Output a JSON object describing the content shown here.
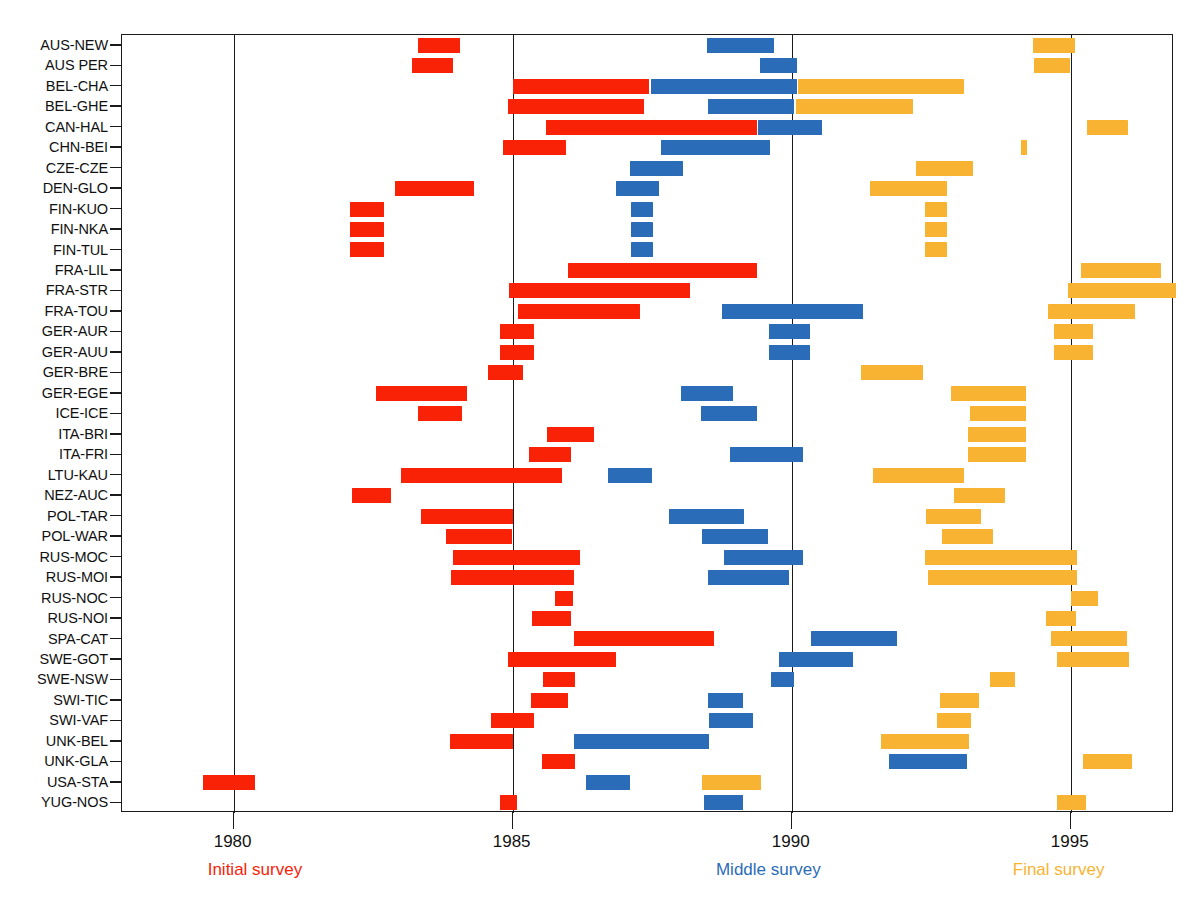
{
  "chart_data": {
    "type": "bar",
    "title": "",
    "xlabel": "",
    "ylabel": "",
    "xlim": [
      1978.0,
      1996.85
    ],
    "grid": true,
    "gridlines": [
      1980,
      1985,
      1990,
      1995
    ],
    "xticks": [
      1980,
      1985,
      1990,
      1995
    ],
    "xtick_labels": [
      "1980",
      "1985",
      "1990",
      "1995"
    ],
    "legend_position": "below-axis",
    "legend": [
      {
        "label": "Initial survey",
        "color": "#f92207",
        "x": 1980.4
      },
      {
        "label": "Middle survey",
        "color": "#2b6cb8",
        "x": 1989.6
      },
      {
        "label": "Final survey",
        "color": "#f9b333",
        "x": 1994.8
      }
    ],
    "series": [
      {
        "name": "Initial survey",
        "color": "#f92207"
      },
      {
        "name": "Middle survey",
        "color": "#2b6cb8"
      },
      {
        "name": "Final survey",
        "color": "#f9b333"
      }
    ],
    "categories": [
      "AUS-NEW",
      "AUS PER",
      "BEL-CHA",
      "BEL-GHE",
      "CAN-HAL",
      "CHN-BEI",
      "CZE-CZE",
      "DEN-GLO",
      "FIN-KUO",
      "FIN-NKA",
      "FIN-TUL",
      "FRA-LIL",
      "FRA-STR",
      "FRA-TOU",
      "GER-AUR",
      "GER-AUU",
      "GER-BRE",
      "GER-EGE",
      "ICE-ICE",
      "ITA-BRI",
      "ITA-FRI",
      "LTU-KAU",
      "NEZ-AUC",
      "POL-TAR",
      "POL-WAR",
      "RUS-MOC",
      "RUS-MOI",
      "RUS-NOC",
      "RUS-NOI",
      "SPA-CAT",
      "SWE-GOT",
      "SWE-NSW",
      "SWI-TIC",
      "SWI-VAF",
      "UNK-BEL",
      "UNK-GLA",
      "USA-STA",
      "YUG-NOS"
    ],
    "rows": [
      {
        "site": "AUS-NEW",
        "bars": [
          {
            "survey": "Initial survey",
            "start": 1983.3,
            "end": 1984.05
          },
          {
            "survey": "Middle survey",
            "start": 1988.48,
            "end": 1989.68
          },
          {
            "survey": "Final survey",
            "start": 1994.32,
            "end": 1995.08
          }
        ]
      },
      {
        "site": "AUS PER",
        "bars": [
          {
            "survey": "Initial survey",
            "start": 1983.2,
            "end": 1983.93
          },
          {
            "survey": "Middle survey",
            "start": 1989.43,
            "end": 1990.1
          },
          {
            "survey": "Final survey",
            "start": 1994.35,
            "end": 1994.98
          }
        ]
      },
      {
        "site": "BEL-CHA",
        "bars": [
          {
            "survey": "Initial survey",
            "start": 1985.0,
            "end": 1987.45
          },
          {
            "survey": "Middle survey",
            "start": 1987.47,
            "end": 1990.1
          },
          {
            "survey": "Final survey",
            "start": 1990.12,
            "end": 1993.08
          }
        ]
      },
      {
        "site": "BEL-GHE",
        "bars": [
          {
            "survey": "Initial survey",
            "start": 1984.92,
            "end": 1987.35
          },
          {
            "survey": "Middle survey",
            "start": 1988.5,
            "end": 1990.05
          },
          {
            "survey": "Final survey",
            "start": 1990.07,
            "end": 1992.18
          }
        ]
      },
      {
        "site": "CAN-HAL",
        "bars": [
          {
            "survey": "Initial survey",
            "start": 1985.6,
            "end": 1989.37
          },
          {
            "survey": "Middle survey",
            "start": 1989.39,
            "end": 1990.55
          },
          {
            "survey": "Final survey",
            "start": 1995.3,
            "end": 1996.02
          }
        ]
      },
      {
        "site": "CHN-BEI",
        "bars": [
          {
            "survey": "Initial survey",
            "start": 1984.82,
            "end": 1985.95
          },
          {
            "survey": "Middle survey",
            "start": 1987.65,
            "end": 1989.62
          },
          {
            "survey": "Final survey",
            "start": 1994.1,
            "end": 1994.22
          }
        ]
      },
      {
        "site": "CZE-CZE",
        "bars": [
          {
            "survey": "Middle survey",
            "start": 1987.1,
            "end": 1988.05
          },
          {
            "survey": "Final survey",
            "start": 1992.23,
            "end": 1993.25
          }
        ]
      },
      {
        "site": "DEN-GLO",
        "bars": [
          {
            "survey": "Initial survey",
            "start": 1982.9,
            "end": 1984.3
          },
          {
            "survey": "Middle survey",
            "start": 1986.85,
            "end": 1987.63
          },
          {
            "survey": "Final survey",
            "start": 1991.4,
            "end": 1992.78
          }
        ]
      },
      {
        "site": "FIN-KUO",
        "bars": [
          {
            "survey": "Initial survey",
            "start": 1982.08,
            "end": 1982.7
          },
          {
            "survey": "Middle survey",
            "start": 1987.12,
            "end": 1987.52
          },
          {
            "survey": "Final survey",
            "start": 1992.38,
            "end": 1992.78
          }
        ]
      },
      {
        "site": "FIN-NKA",
        "bars": [
          {
            "survey": "Initial survey",
            "start": 1982.08,
            "end": 1982.7
          },
          {
            "survey": "Middle survey",
            "start": 1987.12,
            "end": 1987.52
          },
          {
            "survey": "Final survey",
            "start": 1992.38,
            "end": 1992.78
          }
        ]
      },
      {
        "site": "FIN-TUL",
        "bars": [
          {
            "survey": "Initial survey",
            "start": 1982.08,
            "end": 1982.7
          },
          {
            "survey": "Middle survey",
            "start": 1987.12,
            "end": 1987.52
          },
          {
            "survey": "Final survey",
            "start": 1992.38,
            "end": 1992.78
          }
        ]
      },
      {
        "site": "FRA-LIL",
        "bars": [
          {
            "survey": "Initial survey",
            "start": 1986.0,
            "end": 1989.38
          },
          {
            "survey": "Final survey",
            "start": 1995.18,
            "end": 1996.62
          }
        ]
      },
      {
        "site": "FRA-STR",
        "bars": [
          {
            "survey": "Initial survey",
            "start": 1984.93,
            "end": 1988.18
          },
          {
            "survey": "Final survey",
            "start": 1994.95,
            "end": 1996.88
          }
        ]
      },
      {
        "site": "FRA-TOU",
        "bars": [
          {
            "survey": "Initial survey",
            "start": 1985.1,
            "end": 1987.28
          },
          {
            "survey": "Middle survey",
            "start": 1988.75,
            "end": 1991.28
          },
          {
            "survey": "Final survey",
            "start": 1994.6,
            "end": 1996.15
          }
        ]
      },
      {
        "site": "GER-AUR",
        "bars": [
          {
            "survey": "Initial survey",
            "start": 1984.78,
            "end": 1985.38
          },
          {
            "survey": "Middle survey",
            "start": 1989.6,
            "end": 1990.33
          },
          {
            "survey": "Final survey",
            "start": 1994.7,
            "end": 1995.4
          }
        ]
      },
      {
        "site": "GER-AUU",
        "bars": [
          {
            "survey": "Initial survey",
            "start": 1984.78,
            "end": 1985.38
          },
          {
            "survey": "Middle survey",
            "start": 1989.6,
            "end": 1990.33
          },
          {
            "survey": "Final survey",
            "start": 1994.7,
            "end": 1995.4
          }
        ]
      },
      {
        "site": "GER-BRE",
        "bars": [
          {
            "survey": "Initial survey",
            "start": 1984.55,
            "end": 1985.18
          },
          {
            "survey": "Final survey",
            "start": 1991.25,
            "end": 1992.35
          }
        ]
      },
      {
        "site": "GER-EGE",
        "bars": [
          {
            "survey": "Initial survey",
            "start": 1982.55,
            "end": 1984.18
          },
          {
            "survey": "Middle survey",
            "start": 1988.02,
            "end": 1988.95
          },
          {
            "survey": "Final survey",
            "start": 1992.85,
            "end": 1994.2
          }
        ]
      },
      {
        "site": "ICE-ICE",
        "bars": [
          {
            "survey": "Initial survey",
            "start": 1983.3,
            "end": 1984.1
          },
          {
            "survey": "Middle survey",
            "start": 1988.38,
            "end": 1989.38
          },
          {
            "survey": "Final survey",
            "start": 1993.2,
            "end": 1994.2
          }
        ]
      },
      {
        "site": "ITA-BRI",
        "bars": [
          {
            "survey": "Initial survey",
            "start": 1985.62,
            "end": 1986.45
          },
          {
            "survey": "Middle survey",
            "start": 1888.9,
            "end": 1890.2
          },
          {
            "survey": "Final survey",
            "start": 1993.15,
            "end": 1994.2
          }
        ]
      },
      {
        "site": "ITA-FRI",
        "bars": [
          {
            "survey": "Initial survey",
            "start": 1985.3,
            "end": 1986.05
          },
          {
            "survey": "Middle survey",
            "start": 1988.9,
            "end": 1990.2
          },
          {
            "survey": "Final survey",
            "start": 1993.15,
            "end": 1994.2
          }
        ]
      },
      {
        "site": "LTU-KAU",
        "bars": [
          {
            "survey": "Initial survey",
            "start": 1983.0,
            "end": 1985.88
          },
          {
            "survey": "Middle survey",
            "start": 1986.7,
            "end": 1987.5
          },
          {
            "survey": "Final survey",
            "start": 1991.45,
            "end": 1993.08
          }
        ]
      },
      {
        "site": "NEZ-AUC",
        "bars": [
          {
            "survey": "Initial survey",
            "start": 1982.12,
            "end": 1982.82
          },
          {
            "survey": "Final survey",
            "start": 1992.9,
            "end": 1993.82
          }
        ]
      },
      {
        "site": "POL-TAR",
        "bars": [
          {
            "survey": "Initial survey",
            "start": 1983.35,
            "end": 1985.0
          },
          {
            "survey": "Middle survey",
            "start": 1987.8,
            "end": 1989.15
          },
          {
            "survey": "Final survey",
            "start": 1992.4,
            "end": 1993.4
          }
        ]
      },
      {
        "site": "POL-WAR",
        "bars": [
          {
            "survey": "Initial survey",
            "start": 1983.8,
            "end": 1984.98
          },
          {
            "survey": "Middle survey",
            "start": 1988.4,
            "end": 1989.58
          },
          {
            "survey": "Final survey",
            "start": 1992.7,
            "end": 1993.6
          }
        ]
      },
      {
        "site": "RUS-MOC",
        "bars": [
          {
            "survey": "Initial survey",
            "start": 1983.93,
            "end": 1986.2
          },
          {
            "survey": "Middle survey",
            "start": 1988.78,
            "end": 1990.2
          },
          {
            "survey": "Final survey",
            "start": 1992.38,
            "end": 1995.12
          }
        ]
      },
      {
        "site": "RUS-MOI",
        "bars": [
          {
            "survey": "Initial survey",
            "start": 1983.9,
            "end": 1986.1
          },
          {
            "survey": "Middle survey",
            "start": 1988.5,
            "end": 1989.95
          },
          {
            "survey": "Final survey",
            "start": 1992.45,
            "end": 1995.12
          }
        ]
      },
      {
        "site": "RUS-NOC",
        "bars": [
          {
            "survey": "Initial survey",
            "start": 1985.75,
            "end": 1986.08
          },
          {
            "survey": "Final survey",
            "start": 1995.0,
            "end": 1995.48
          }
        ]
      },
      {
        "site": "RUS-NOI",
        "bars": [
          {
            "survey": "Initial survey",
            "start": 1985.35,
            "end": 1986.05
          },
          {
            "survey": "Final survey",
            "start": 1994.55,
            "end": 1995.1
          }
        ]
      },
      {
        "site": "SPA-CAT",
        "bars": [
          {
            "survey": "Initial survey",
            "start": 1986.1,
            "end": 1988.6
          },
          {
            "survey": "Middle survey",
            "start": 1990.35,
            "end": 1991.88
          },
          {
            "survey": "Final survey",
            "start": 1994.65,
            "end": 1996.0
          }
        ]
      },
      {
        "site": "SWE-GOT",
        "bars": [
          {
            "survey": "Initial survey",
            "start": 1984.92,
            "end": 1986.85
          },
          {
            "survey": "Middle survey",
            "start": 1989.78,
            "end": 1991.1
          },
          {
            "survey": "Final survey",
            "start": 1994.75,
            "end": 1996.05
          }
        ]
      },
      {
        "site": "SWE-NSW",
        "bars": [
          {
            "survey": "Initial survey",
            "start": 1985.55,
            "end": 1986.12
          },
          {
            "survey": "Middle survey",
            "start": 1989.62,
            "end": 1990.05
          },
          {
            "survey": "Final survey",
            "start": 1993.55,
            "end": 1994.0
          }
        ]
      },
      {
        "site": "SWI-TIC",
        "bars": [
          {
            "survey": "Initial survey",
            "start": 1985.32,
            "end": 1986.0
          },
          {
            "survey": "Middle survey",
            "start": 1988.5,
            "end": 1989.12
          },
          {
            "survey": "Final survey",
            "start": 1992.65,
            "end": 1993.35
          }
        ]
      },
      {
        "site": "SWI-VAF",
        "bars": [
          {
            "survey": "Initial survey",
            "start": 1984.62,
            "end": 1985.38
          },
          {
            "survey": "Middle survey",
            "start": 1988.52,
            "end": 1989.3
          },
          {
            "survey": "Final survey",
            "start": 1992.6,
            "end": 1993.22
          }
        ]
      },
      {
        "site": "UNK-BEL",
        "bars": [
          {
            "survey": "Initial survey",
            "start": 1983.88,
            "end": 1985.0
          },
          {
            "survey": "Middle survey",
            "start": 1986.1,
            "end": 1988.52
          },
          {
            "survey": "Final survey",
            "start": 1991.6,
            "end": 1993.18
          }
        ]
      },
      {
        "site": "UNK-GLA",
        "bars": [
          {
            "survey": "Initial survey",
            "start": 1985.52,
            "end": 1986.12
          },
          {
            "survey": "Middle survey",
            "start": 1991.75,
            "end": 1993.15
          },
          {
            "survey": "Final survey",
            "start": 1995.22,
            "end": 1996.1
          }
        ]
      },
      {
        "site": "USA-STA",
        "bars": [
          {
            "survey": "Initial survey",
            "start": 1979.45,
            "end": 1980.38
          },
          {
            "survey": "Middle survey",
            "start": 1986.32,
            "end": 1987.1
          },
          {
            "survey": "Final survey",
            "start": 1988.4,
            "end": 1989.45
          }
        ]
      },
      {
        "site": "YUG-NOS",
        "bars": [
          {
            "survey": "Initial survey",
            "start": 1984.78,
            "end": 1985.08
          },
          {
            "survey": "Middle survey",
            "start": 1988.42,
            "end": 1989.12
          },
          {
            "survey": "Final survey",
            "start": 1994.75,
            "end": 1995.28
          }
        ]
      }
    ]
  }
}
